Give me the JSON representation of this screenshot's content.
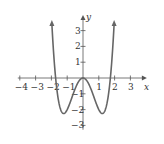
{
  "chart_data": {
    "type": "line",
    "title": "",
    "function": "y = x^4 - 3x^2",
    "xlabel": "x",
    "ylabel": "y",
    "xlim": [
      -4,
      3.6
    ],
    "ylim": [
      -3.4,
      3.6
    ],
    "x_ticks": [
      -4,
      -3,
      -2,
      -1,
      1,
      2,
      3
    ],
    "y_ticks": [
      -3,
      -2,
      -1,
      1,
      2,
      3
    ],
    "grid": false,
    "curve_color": "#666666",
    "axis_color": "#555555",
    "series": [
      {
        "name": "f(x)",
        "x": [
          -1.95,
          -1.8,
          -1.73,
          -1.6,
          -1.4,
          -1.22,
          -1.0,
          -0.8,
          -0.6,
          -0.4,
          -0.2,
          0,
          0.2,
          0.4,
          0.6,
          0.8,
          1.0,
          1.22,
          1.4,
          1.6,
          1.73,
          1.8,
          1.95
        ],
        "values": [
          3.05,
          0.78,
          0.0,
          -1.13,
          -2.04,
          -2.25,
          -2.0,
          -1.51,
          -0.95,
          -0.45,
          -0.12,
          0,
          -0.12,
          -0.45,
          -0.95,
          -1.51,
          -2.0,
          -2.25,
          -2.04,
          -1.13,
          0.0,
          0.78,
          3.05
        ]
      }
    ]
  }
}
